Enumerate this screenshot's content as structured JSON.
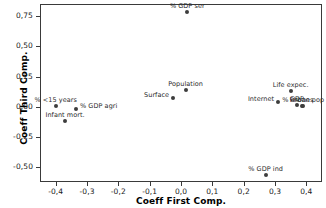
{
  "chart_data": {
    "type": "scatter",
    "title": "",
    "xlabel": "Coeff First Comp.",
    "ylabel": "Coeff Third Comp.",
    "xlim": [
      -0.45,
      0.45
    ],
    "ylim": [
      -0.62,
      0.85
    ],
    "grid": false,
    "legend": "none",
    "decimal_separator": ",",
    "xticks": [
      -0.4,
      -0.3,
      -0.2,
      -0.1,
      0.0,
      0.1,
      0.2,
      0.3,
      0.4
    ],
    "xticklabels": [
      "-0,4",
      "-0,3",
      "-0,2",
      "-0,1",
      "0,0",
      "0,1",
      "0,2",
      "0,3",
      "0,4"
    ],
    "yticks": [
      0.75,
      0.5,
      0.25,
      0.0,
      -0.25,
      -0.5
    ],
    "yticklabels": [
      "0,75",
      "0,50",
      "0,25",
      "0,00",
      "-0,25",
      "-0,50"
    ],
    "points": [
      {
        "label": "% GDP ser",
        "x": 0.02,
        "y": 0.78,
        "label_pos": "above-center"
      },
      {
        "label": "Population",
        "x": 0.015,
        "y": 0.14,
        "label_pos": "above-center"
      },
      {
        "label": "Surface",
        "x": -0.025,
        "y": 0.07,
        "label_pos": "left"
      },
      {
        "label": "Life expec.",
        "x": 0.35,
        "y": 0.13,
        "label_pos": "above-center"
      },
      {
        "label": "Internet",
        "x": 0.31,
        "y": 0.04,
        "label_pos": "left"
      },
      {
        "label": "GDP",
        "x": 0.37,
        "y": 0.015,
        "label_pos": "above-center"
      },
      {
        "label": "Phones",
        "x": 0.385,
        "y": 0.01,
        "label_pos": "above-center"
      },
      {
        "label": "% urban pop",
        "x": 0.39,
        "y": 0.008,
        "label_pos": "above-center"
      },
      {
        "label": "% <15 years",
        "x": -0.4,
        "y": 0.005,
        "label_pos": "above-center"
      },
      {
        "label": "% GDP agri",
        "x": -0.335,
        "y": -0.02,
        "label_pos": "right"
      },
      {
        "label": "Infant mort.",
        "x": -0.37,
        "y": -0.115,
        "label_pos": "above-center"
      },
      {
        "label": "% GDP ind",
        "x": 0.27,
        "y": -0.565,
        "label_pos": "above-center"
      }
    ],
    "marker_color": "#3d3d3d",
    "frame_color": "#3a3a3a"
  }
}
